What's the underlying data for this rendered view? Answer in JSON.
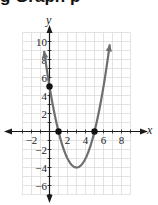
{
  "heading": {
    "text": "g   Graph   p"
  },
  "chart_data": {
    "type": "line",
    "title": "",
    "function": "y = x^2 - 6x + 5",
    "xlabel": "x",
    "ylabel": "y",
    "xlim": [
      -3,
      9
    ],
    "ylim": [
      -7,
      11
    ],
    "grid": true,
    "x_ticks": [
      -2,
      2,
      4,
      6,
      8
    ],
    "y_ticks": [
      10,
      8,
      6,
      4,
      2,
      -2,
      -4,
      -6
    ],
    "series": [
      {
        "name": "parabola",
        "color": "#6e6e6e",
        "x": [
          -0.6,
          0,
          1,
          2,
          3,
          4,
          5,
          6,
          6.7
        ],
        "y": [
          9.96,
          5,
          0,
          -3,
          -4,
          -3,
          0,
          5,
          10.69
        ]
      }
    ],
    "marked_points": [
      {
        "x": 0,
        "y": 5,
        "label": "y-intercept"
      },
      {
        "x": 1,
        "y": 0,
        "label": "x-intercept"
      },
      {
        "x": 5,
        "y": 0,
        "label": "x-intercept"
      }
    ],
    "vertex": {
      "x": 3,
      "y": -4
    },
    "colors": {
      "grid": "#dcdcdc",
      "axis": "#1a1a1a",
      "curve": "#6e6e6e",
      "points": "#111111"
    }
  }
}
